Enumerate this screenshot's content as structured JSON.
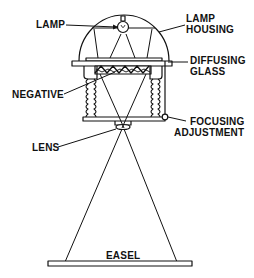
{
  "diagram": {
    "type": "enlarger-schematic",
    "colors": {
      "stroke": "#111111",
      "background": "#ffffff"
    },
    "labels": {
      "lamp": "LAMP",
      "lamp_housing_line1": "LAMP",
      "lamp_housing_line2": "HOUSING",
      "diffusing_glass_line1": "DIFFUSING",
      "diffusing_glass_line2": "GLASS",
      "negative": "NEGATIVE",
      "focusing_adjustment_line1": "FOCUSING",
      "focusing_adjustment_line2": "ADJUSTMENT",
      "lens": "LENS",
      "easel": "EASEL"
    },
    "components": [
      "lamp",
      "lamp-housing",
      "diffusing-glass",
      "negative",
      "bellows",
      "focusing-adjustment",
      "lens",
      "easel"
    ]
  }
}
